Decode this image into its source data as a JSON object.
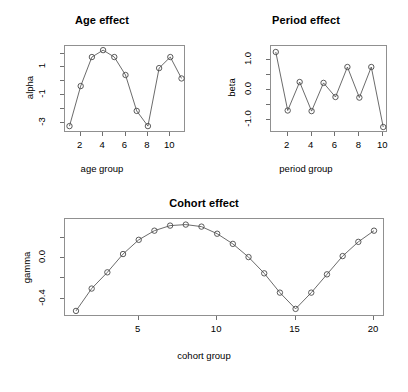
{
  "figure": {
    "background": "#ffffff",
    "line_color": "#5a5a5a",
    "point_color": "#4a4a4a",
    "axis_color": "#909090",
    "panel_count": 3
  },
  "chart_data": [
    {
      "id": "age",
      "type": "line",
      "title": "Age effect",
      "xlabel": "age group",
      "ylabel": "alpha",
      "marker": "open-circle",
      "grid": false,
      "legend": null,
      "x": [
        1,
        2,
        3,
        4,
        5,
        6,
        7,
        8,
        9,
        10,
        11
      ],
      "values": [
        -3.25,
        -0.35,
        1.75,
        2.25,
        1.75,
        0.45,
        -2.15,
        -3.25,
        0.95,
        1.75,
        0.2
      ],
      "xlim": [
        0.6,
        11.4
      ],
      "ylim": [
        -3.75,
        2.55
      ],
      "xticks": [
        2,
        4,
        6,
        8,
        10
      ],
      "xticklabels": [
        "2",
        "4",
        "6",
        "8",
        "10"
      ],
      "yticks": [
        -3,
        -1,
        1
      ],
      "yticklabels": [
        "-3",
        "-1",
        "1"
      ],
      "yminorticks": [
        -2,
        0,
        2
      ]
    },
    {
      "id": "period",
      "type": "line",
      "title": "Period effect",
      "xlabel": "period group",
      "ylabel": "beta",
      "marker": "open-circle",
      "grid": false,
      "legend": null,
      "x": [
        1,
        2,
        3,
        4,
        5,
        6,
        7,
        8,
        9,
        10
      ],
      "values": [
        1.25,
        -0.7,
        0.25,
        -0.72,
        0.22,
        -0.25,
        0.75,
        -0.27,
        0.75,
        -1.25
      ],
      "xlim": [
        0.6,
        10.4
      ],
      "ylim": [
        -1.45,
        1.45
      ],
      "xticks": [
        2,
        4,
        6,
        8,
        10
      ],
      "xticklabels": [
        "2",
        "4",
        "6",
        "8",
        "10"
      ],
      "yticks": [
        -1.0,
        0.0,
        1.0
      ],
      "yticklabels": [
        "-1.0",
        "0.0",
        "1.0"
      ],
      "yminorticks": [
        -0.5,
        0.5
      ]
    },
    {
      "id": "cohort",
      "type": "line",
      "title": "Cohort effect",
      "xlabel": "cohort group",
      "ylabel": "gamma",
      "marker": "open-circle",
      "grid": false,
      "legend": null,
      "x": [
        1,
        2,
        3,
        4,
        5,
        6,
        7,
        8,
        9,
        10,
        11,
        12,
        13,
        14,
        15,
        16,
        17,
        18,
        19,
        20
      ],
      "values": [
        -0.52,
        -0.3,
        -0.14,
        0.04,
        0.18,
        0.27,
        0.32,
        0.33,
        0.31,
        0.24,
        0.14,
        0.01,
        -0.15,
        -0.34,
        -0.5,
        -0.34,
        -0.16,
        0.02,
        0.16,
        0.27
      ],
      "xlim": [
        0.3,
        20.7
      ],
      "ylim": [
        -0.58,
        0.385
      ],
      "xticks": [
        5,
        10,
        15,
        20
      ],
      "xticklabels": [
        "5",
        "10",
        "15",
        "20"
      ],
      "yticks": [
        -0.4,
        0.0
      ],
      "yticklabels": [
        "-0.4",
        "0.0"
      ],
      "yminorticks": [
        -0.2,
        0.2
      ]
    }
  ]
}
